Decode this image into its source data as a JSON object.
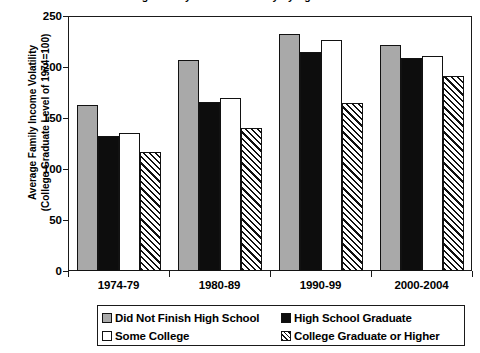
{
  "chart_data": {
    "type": "bar",
    "title": "Average Family Income Volatility by Age and Education Levels",
    "xlabel": "",
    "ylabel_line1": "Average Family Income Volatility",
    "ylabel_line2": "(College Graduate Level of 1974=100)",
    "categories": [
      "1974-79",
      "1980-89",
      "1990-99",
      "2000-2004"
    ],
    "ylim": [
      0,
      250
    ],
    "yticks": [
      0,
      50,
      100,
      150,
      200,
      250
    ],
    "grid": false,
    "legend_position": "bottom",
    "series": [
      {
        "name": "Did Not Finish High School",
        "fill": "gray",
        "color": "#a9a9a9",
        "values": [
          163,
          207,
          232,
          222
        ]
      },
      {
        "name": "High School Graduate",
        "fill": "black",
        "color": "#0d0d0d",
        "values": [
          132,
          166,
          215,
          209
        ]
      },
      {
        "name": "Some College",
        "fill": "white",
        "color": "#ffffff",
        "values": [
          135,
          170,
          226,
          211
        ]
      },
      {
        "name": "College Graduate or Higher",
        "fill": "diagonal-hatch",
        "color": "#ffffff",
        "values": [
          117,
          140,
          165,
          191
        ]
      }
    ]
  },
  "legend": {
    "items": [
      "Did Not Finish High School",
      "High School Graduate",
      "Some College",
      "College Graduate or Higher"
    ]
  }
}
